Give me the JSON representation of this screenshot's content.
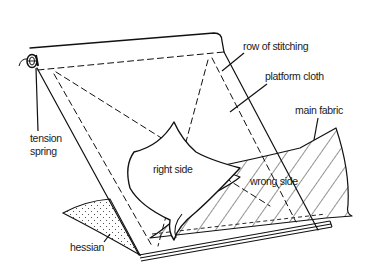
{
  "diagram": {
    "type": "technical illustration",
    "labels": {
      "row_of_stitching": "row of stitching",
      "platform_cloth": "platform cloth",
      "main_fabric": "main fabric",
      "tension_spring_line1": "tension",
      "tension_spring_line2": "spring",
      "right_side": "right side",
      "wrong_side": "wrong side",
      "hessian": "hessian"
    },
    "colors": {
      "ink": "#111111",
      "paper": "#ffffff",
      "text": "#1a1a1a"
    }
  }
}
